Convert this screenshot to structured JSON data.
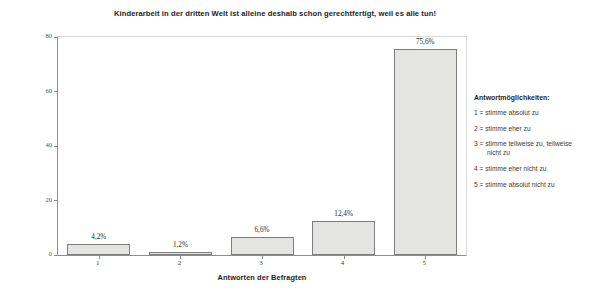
{
  "chart_data": {
    "type": "bar",
    "title": "Kinderarbeit in der dritten Welt ist alleine deshalb schon gerechtfertigt, weil es alle tun!",
    "xlabel": "Antworten der Befragten",
    "ylabel": "Prozent",
    "categories": [
      "1",
      "2",
      "3",
      "4",
      "5"
    ],
    "values": [
      4.2,
      1.2,
      6.6,
      12.4,
      75.6
    ],
    "value_labels": [
      "4,2%",
      "1,2%",
      "6,6%",
      "12,4%",
      "75,6%"
    ],
    "ylim": [
      0,
      80
    ],
    "yticks": [
      0,
      20,
      40,
      60,
      80
    ],
    "ytick_labels": [
      "0",
      "20",
      "40",
      "60",
      "80"
    ],
    "grid": false,
    "legend_position": "right-outside",
    "bar_fill_color": "#e4e4e2",
    "bar_border_color": "#7d7d7d"
  },
  "legend": {
    "title": "Antwortmöglichkeiten:",
    "items": [
      "1 = stimme absolut zu",
      "2 = stimme eher zu",
      "3 = stimme teilweise zu, teilweise nicht zu",
      "4 = stimme eher nicht zu",
      "5 = stimme absolut nicht zu"
    ]
  }
}
